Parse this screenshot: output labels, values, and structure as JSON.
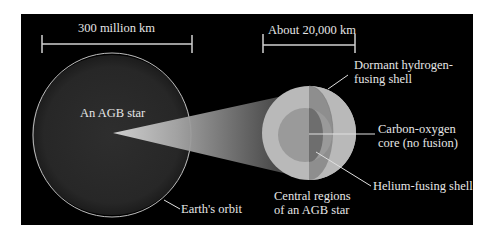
{
  "diagram": {
    "scale_bars": [
      {
        "label": "300 million km"
      },
      {
        "label": "About 20,000 km"
      }
    ],
    "star": {
      "label": "An AGB star",
      "orbit_label": "Earth's orbit"
    },
    "cross_section": {
      "title_line1": "Central regions",
      "title_line2": "of an AGB star",
      "layers": [
        {
          "line1": "Dormant hydrogen-",
          "line2": "fusing shell"
        },
        {
          "line1": "Carbon-oxygen",
          "line2": "core (no fusion)"
        },
        {
          "line1": "Helium-fusing shell"
        }
      ]
    },
    "colors": {
      "background": "#000000",
      "star_fill": "#2a2a2a",
      "orbit_line": "#bdbdbd",
      "outer_shell": "#b9b9b9",
      "outer_shell_cut": "#8e8e8e",
      "core": "#9a9a9a",
      "core_cut": "#6e6e6e",
      "text": "#e6e6e6"
    }
  }
}
